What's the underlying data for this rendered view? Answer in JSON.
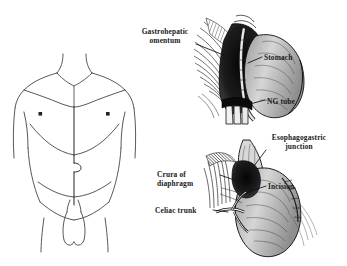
{
  "figure": {
    "background_color": "#ffffff",
    "ink_color": "#1a1a1a",
    "panels": [
      {
        "name": "anterior-torso",
        "description": "Anterior line drawing of male torso with midline incision marking"
      },
      {
        "name": "upper-operative-view",
        "description": "Pen-and-ink operative exposure of stomach with nasogastric tube"
      },
      {
        "name": "lower-operative-view",
        "description": "Pen-and-ink operative exposure of esophagogastric junction, crura and celiac trunk"
      }
    ]
  },
  "labels": {
    "gastrohepatic_omentum": "Gastrohepatic\nomentum",
    "stomach": "Stomach",
    "ng_tube": "NG tube",
    "esophagogastric_junction": "Esophagogastric\njunction",
    "incision": "Incision",
    "crura_of_diaphragm": "Crura of\ndiaphragm",
    "celiac_trunk": "Celiac trunk"
  }
}
